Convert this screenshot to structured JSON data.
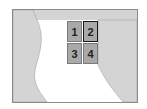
{
  "map": {
    "tiles": [
      {
        "label": "1",
        "selected": false
      },
      {
        "label": "2",
        "selected": true
      },
      {
        "label": "3",
        "selected": false
      },
      {
        "label": "4",
        "selected": false
      }
    ],
    "colors": {
      "land": "#d4d4d4",
      "water": "#ffffff",
      "tile": "#a9a9a9",
      "border": "#8a8a8a"
    }
  }
}
